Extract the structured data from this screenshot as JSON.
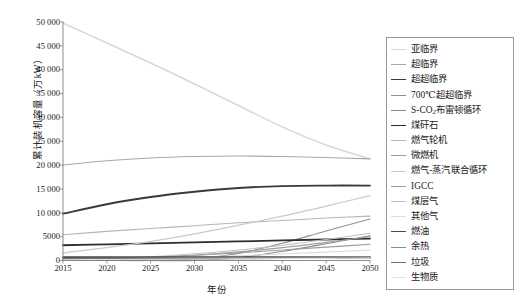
{
  "chart_data": {
    "type": "line",
    "title": "",
    "xlabel": "年份",
    "ylabel": "累计装机容量（万kW）",
    "xlim": [
      2015,
      2050
    ],
    "ylim": [
      0,
      50000
    ],
    "x": [
      2015,
      2020,
      2025,
      2030,
      2035,
      2040,
      2045,
      2050
    ],
    "xticks": [
      "2015",
      "2020",
      "2025",
      "2030",
      "2035",
      "2040",
      "2045",
      "2050"
    ],
    "yticks": [
      "0",
      "5000",
      "10 000",
      "15 000",
      "20 000",
      "25 000",
      "30 000",
      "35 000",
      "40 000",
      "45 000",
      "50 000"
    ],
    "ytick_values": [
      0,
      5000,
      10000,
      15000,
      20000,
      25000,
      30000,
      35000,
      40000,
      45000,
      50000
    ],
    "grid": false,
    "legend_position": "right",
    "series": [
      {
        "name": "亚临界",
        "color": "#d8d8d8",
        "width": 1.5,
        "values": [
          49800,
          45600,
          41400,
          37000,
          32500,
          28000,
          24200,
          21300
        ]
      },
      {
        "name": "超临界",
        "color": "#a8a8a8",
        "width": 1.1,
        "values": [
          20000,
          20900,
          21500,
          21800,
          21900,
          21800,
          21600,
          21300
        ]
      },
      {
        "name": "超超临界",
        "color": "#3a3a3a",
        "width": 1.9,
        "values": [
          9800,
          11800,
          13300,
          14400,
          15200,
          15600,
          15700,
          15700
        ]
      },
      {
        "name": "700℃超超临界",
        "color": "#909090",
        "width": 1.1,
        "values": [
          0,
          0,
          0,
          300,
          1500,
          3600,
          6200,
          8700
        ]
      },
      {
        "name": "S-CO2布雷顿循环",
        "color": "#8a8a8a",
        "width": 1.1,
        "values": [
          0,
          0,
          0,
          0,
          600,
          1900,
          3500,
          5200
        ]
      },
      {
        "name": "煤矸石",
        "color": "#2e2e2e",
        "width": 1.8,
        "values": [
          3200,
          3400,
          3600,
          3800,
          4000,
          4200,
          4400,
          4600
        ]
      },
      {
        "name": "燃气轮机",
        "color": "#b5b5b5",
        "width": 1.1,
        "values": [
          5400,
          6100,
          6700,
          7300,
          7900,
          8400,
          8900,
          9300
        ]
      },
      {
        "name": "微燃机",
        "color": "#9c9c9c",
        "width": 1.1,
        "values": [
          200,
          400,
          700,
          1100,
          1600,
          2200,
          2800,
          3400
        ]
      },
      {
        "name": "燃气-蒸汽联合循环",
        "color": "#cacaca",
        "width": 1.2,
        "values": [
          1600,
          2700,
          4000,
          5600,
          7400,
          9300,
          11400,
          13600
        ]
      },
      {
        "name": "IGCC",
        "color": "#9f9f9f",
        "width": 1.1,
        "values": [
          100,
          300,
          600,
          1100,
          1800,
          2700,
          3800,
          5000
        ]
      },
      {
        "name": "煤层气",
        "color": "#c0c0c0",
        "width": 1.1,
        "values": [
          150,
          400,
          800,
          1400,
          2200,
          3200,
          4400,
          5700
        ]
      },
      {
        "name": "其他气",
        "color": "#dcdcdc",
        "width": 1.1,
        "values": [
          100,
          250,
          450,
          700,
          1000,
          1350,
          1750,
          2200
        ]
      },
      {
        "name": "燃油",
        "color": "#4a4a4a",
        "width": 1.7,
        "values": [
          700,
          700,
          700,
          700,
          700,
          700,
          700,
          700
        ]
      },
      {
        "name": "余热",
        "color": "#8c8c8c",
        "width": 1.2,
        "values": [
          400,
          450,
          500,
          550,
          600,
          650,
          700,
          750
        ]
      },
      {
        "name": "垃圾",
        "color": "#707070",
        "width": 1.5,
        "values": [
          300,
          330,
          360,
          390,
          420,
          450,
          480,
          500
        ]
      },
      {
        "name": "生物质",
        "color": "#e0e0e0",
        "width": 1.1,
        "values": [
          150,
          200,
          250,
          300,
          350,
          400,
          450,
          500
        ]
      }
    ]
  },
  "legend": {
    "items": [
      {
        "label": "亚临界"
      },
      {
        "label": "超临界"
      },
      {
        "label": "超超临界"
      },
      {
        "label": "700℃超超临界"
      },
      {
        "label": "S-CO",
        "sub": "2",
        "label_tail": "布雷顿循环"
      },
      {
        "label": "煤矸石"
      },
      {
        "label": "燃气轮机"
      },
      {
        "label": "微燃机"
      },
      {
        "label": "燃气-蒸汽联合循环"
      },
      {
        "label": "IGCC"
      },
      {
        "label": "煤层气"
      },
      {
        "label": "其他气"
      },
      {
        "label": "燃油"
      },
      {
        "label": "余热"
      },
      {
        "label": "垃圾"
      },
      {
        "label": "生物质"
      }
    ]
  },
  "axis": {
    "frame_color": "#808080"
  }
}
